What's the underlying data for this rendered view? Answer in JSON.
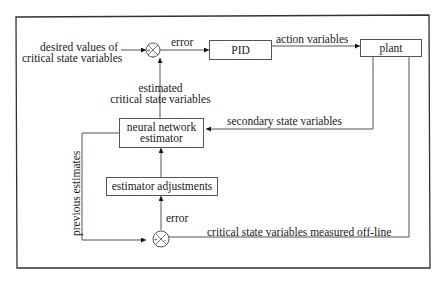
{
  "diagram": {
    "type": "control-loop-block-diagram",
    "blocks": {
      "pid": "PID",
      "plant": "plant",
      "nn_line1": "neural network",
      "nn_line2": "estimator",
      "adjust": "estimator adjustments"
    },
    "labels": {
      "desired_line1": "desired values of",
      "desired_line2": "critical state variables",
      "error_top": "error",
      "action": "action variables",
      "estimated_line1": "estimated",
      "estimated_line2": "critical state variables",
      "secondary": "secondary state variables",
      "previous": "previous estimates",
      "error_bottom": "error",
      "offline": "critical state variables measured off-line"
    },
    "junction_signs": {
      "top_plus": "+",
      "top_minus": "-",
      "bottom_plus": "+",
      "bottom_minus": "-"
    },
    "colors": {
      "line": "#555555",
      "frame": "#333333",
      "text": "#1a1a1a",
      "background": "#ffffff"
    }
  }
}
